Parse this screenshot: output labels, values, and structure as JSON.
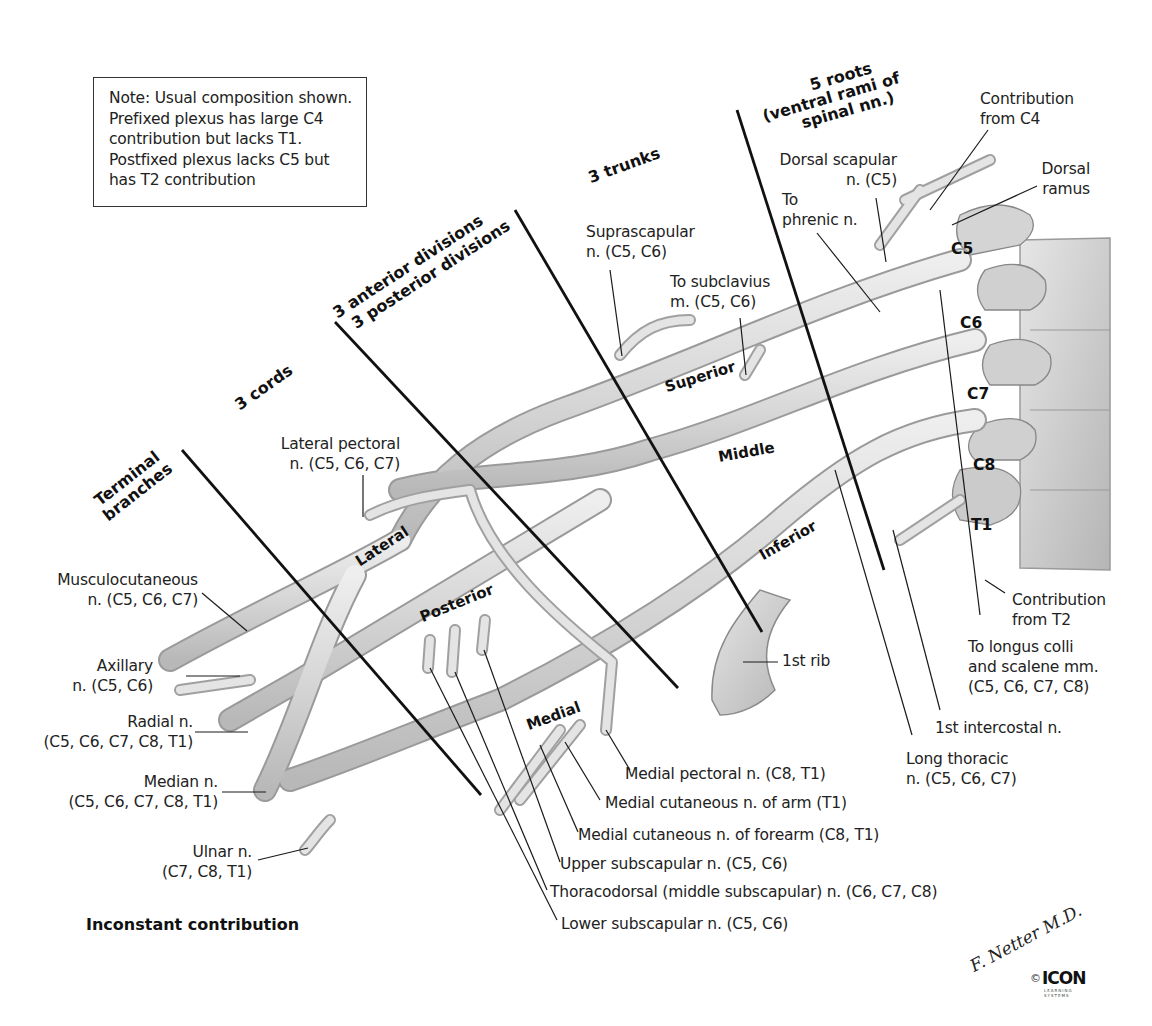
{
  "note_box": {
    "lines": [
      "Note: Usual composition shown.",
      "Prefixed plexus has large C4",
      "contribution but lacks T1.",
      "Postfixed plexus lacks C5 but",
      "has T2 contribution"
    ]
  },
  "section_headers": {
    "roots": [
      "5 roots",
      "(ventral rami of",
      "spinal nn.)"
    ],
    "trunks": "3 trunks",
    "divisions": [
      "3 anterior divisions",
      "3 posterior divisions"
    ],
    "cords": "3 cords",
    "terminal": [
      "Terminal",
      "branches"
    ]
  },
  "part_labels": {
    "superior": "Superior",
    "middle": "Middle",
    "inferior": "Inferior",
    "lateral": "Lateral",
    "posterior": "Posterior",
    "medial": "Medial"
  },
  "spinal_segments": [
    "C5",
    "C6",
    "C7",
    "C8",
    "T1"
  ],
  "labels": {
    "contribution_c4": [
      "Contribution",
      "from C4"
    ],
    "dorsal_ramus": [
      "Dorsal",
      "ramus"
    ],
    "dorsal_scapular": [
      "Dorsal scapular",
      "n. (C5)"
    ],
    "to_phrenic": [
      "To",
      "phrenic n."
    ],
    "suprascapular": [
      "Suprascapular",
      "n. (C5, C6)"
    ],
    "to_subclavius": [
      "To subclavius",
      "m. (C5, C6)"
    ],
    "lateral_pectoral": [
      "Lateral pectoral",
      "n. (C5, C6, C7)"
    ],
    "musculocutaneous": [
      "Musculocutaneous",
      "n. (C5, C6, C7)"
    ],
    "axillary": [
      "Axillary",
      "n. (C5, C6)"
    ],
    "radial": [
      "Radial n.",
      "(C5, C6, C7, C8, T1)"
    ],
    "median": [
      "Median n.",
      "(C5, C6, C7, C8, T1)"
    ],
    "ulnar": [
      "Ulnar n.",
      "(C7, C8, T1)"
    ],
    "first_rib": "1st rib",
    "contribution_t2": [
      "Contribution",
      "from T2"
    ],
    "longus_colli": [
      "To longus colli",
      "and scalene mm.",
      "(C5, C6, C7, C8)"
    ],
    "first_intercostal": "1st intercostal n.",
    "long_thoracic": [
      "Long thoracic",
      "n. (C5, C6, C7)"
    ],
    "medial_pectoral": "Medial pectoral n. (C8, T1)",
    "medial_cutaneous_arm": "Medial cutaneous n. of arm (T1)",
    "medial_cutaneous_forearm": "Medial cutaneous n. of forearm (C8, T1)",
    "upper_subscapular": "Upper subscapular n. (C5, C6)",
    "thoracodorsal": "Thoracodorsal (middle subscapular) n. (C6, C7, C8)",
    "lower_subscapular": "Lower subscapular n. (C5, C6)"
  },
  "footer": {
    "inconstant": "Inconstant contribution",
    "signature": "F. Netter M.D.",
    "copyright": "©",
    "publisher": "ICON",
    "publisher_sub": "LEARNING SYSTEMS"
  },
  "colors": {
    "nerve_fill": "#d9d9d9",
    "nerve_edge": "#9a9a9a",
    "bone_fill": "#cfcfcf",
    "leader": "#1a1a1a"
  }
}
